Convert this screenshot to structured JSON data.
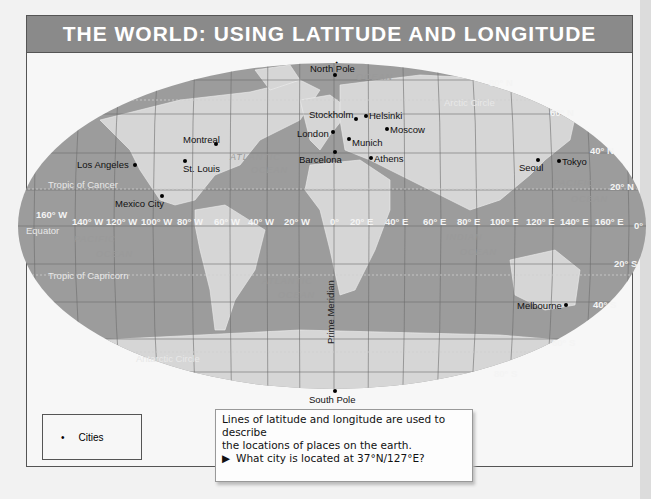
{
  "title": "THE WORLD: USING LATITUDE AND LONGITUDE",
  "poles": {
    "north": "North Pole",
    "south": "South Pole"
  },
  "cities": [
    {
      "name": "Los Angeles",
      "x": 135,
      "y": 165,
      "lx": 77,
      "ly": 159
    },
    {
      "name": "St. Louis",
      "x": 185,
      "y": 161,
      "lx": 183,
      "ly": 163
    },
    {
      "name": "Montreal",
      "x": 216,
      "y": 144,
      "lx": 183,
      "ly": 134
    },
    {
      "name": "Mexico City",
      "x": 162,
      "y": 196,
      "lx": 115,
      "ly": 198
    },
    {
      "name": "Stockholm",
      "x": 356,
      "y": 119,
      "lx": 309,
      "ly": 109
    },
    {
      "name": "Helsinki",
      "x": 366,
      "y": 116,
      "lx": 369,
      "ly": 110
    },
    {
      "name": "London",
      "x": 333,
      "y": 132,
      "lx": 297,
      "ly": 128
    },
    {
      "name": "Moscow",
      "x": 387,
      "y": 129,
      "lx": 390,
      "ly": 124
    },
    {
      "name": "Munich",
      "x": 349,
      "y": 139,
      "lx": 352,
      "ly": 137
    },
    {
      "name": "Barcelona",
      "x": 335,
      "y": 152,
      "lx": 299,
      "ly": 154
    },
    {
      "name": "Athens",
      "x": 371,
      "y": 158,
      "lx": 374,
      "ly": 153
    },
    {
      "name": "Seoul",
      "x": 538,
      "y": 160,
      "lx": 519,
      "ly": 162
    },
    {
      "name": "Tokyo",
      "x": 559,
      "y": 161,
      "lx": 562,
      "ly": 156
    },
    {
      "name": "Melbourne",
      "x": 566,
      "y": 305,
      "lx": 517,
      "ly": 300
    }
  ],
  "latitude_labels": [
    {
      "text": "80° N",
      "x": 489,
      "y": 83
    },
    {
      "text": "60° N",
      "x": 550,
      "y": 113
    },
    {
      "text": "40° N",
      "x": 590,
      "y": 151
    },
    {
      "text": "20° N",
      "x": 610,
      "y": 187
    },
    {
      "text": "0°",
      "x": 634,
      "y": 226
    },
    {
      "text": "20° S",
      "x": 614,
      "y": 264
    },
    {
      "text": "40° S",
      "x": 593,
      "y": 305
    },
    {
      "text": "60° S",
      "x": 552,
      "y": 343
    },
    {
      "text": "80° S",
      "x": 494,
      "y": 374
    }
  ],
  "longitude_labels": [
    {
      "text": "160° W",
      "x": 36,
      "y": 215
    },
    {
      "text": "140° W",
      "x": 72,
      "y": 222
    },
    {
      "text": "120° W",
      "x": 106,
      "y": 222
    },
    {
      "text": "100° W",
      "x": 141,
      "y": 222
    },
    {
      "text": "80° W",
      "x": 177,
      "y": 222
    },
    {
      "text": "60° W",
      "x": 214,
      "y": 222
    },
    {
      "text": "40° W",
      "x": 248,
      "y": 222
    },
    {
      "text": "20° W",
      "x": 284,
      "y": 222
    },
    {
      "text": "0°",
      "x": 330,
      "y": 222
    },
    {
      "text": "20° E",
      "x": 350,
      "y": 222
    },
    {
      "text": "40° E",
      "x": 385,
      "y": 222
    },
    {
      "text": "60° E",
      "x": 423,
      "y": 222
    },
    {
      "text": "80° E",
      "x": 457,
      "y": 222
    },
    {
      "text": "100° E",
      "x": 490,
      "y": 222
    },
    {
      "text": "120° E",
      "x": 526,
      "y": 222
    },
    {
      "text": "140° E",
      "x": 560,
      "y": 222
    },
    {
      "text": "160° E",
      "x": 595,
      "y": 222
    }
  ],
  "line_labels": [
    {
      "text": "Equator",
      "x": 26,
      "y": 231
    },
    {
      "text": "Tropic of Cancer",
      "x": 48,
      "y": 185
    },
    {
      "text": "Tropic of Capricorn",
      "x": 48,
      "y": 276
    },
    {
      "text": "Arctic Circle",
      "x": 444,
      "y": 103
    },
    {
      "text": "Antarctic Circle",
      "x": 136,
      "y": 359
    }
  ],
  "ocean_labels": [
    {
      "text": "ATLANTIC",
      "x": 230,
      "y": 158
    },
    {
      "text": "OCEAN",
      "x": 251,
      "y": 171
    },
    {
      "text": "PACIFIC",
      "x": 74,
      "y": 240
    },
    {
      "text": "OCEAN",
      "x": 96,
      "y": 255
    },
    {
      "text": "ATLANTIC",
      "x": 262,
      "y": 282
    },
    {
      "text": "OCEAN",
      "x": 278,
      "y": 296
    },
    {
      "text": "INDIAN",
      "x": 446,
      "y": 238
    },
    {
      "text": "OCEAN",
      "x": 460,
      "y": 253
    },
    {
      "text": "PACIFIC",
      "x": 553,
      "y": 184
    },
    {
      "text": "OCEAN",
      "x": 571,
      "y": 200
    },
    {
      "text": "OCEAN",
      "x": 356,
      "y": 78
    }
  ],
  "prime_meridian_label": "Prime Meridian",
  "legend": {
    "symbol": "•",
    "label": "Cities"
  },
  "note": {
    "line1": "Lines of latitude and longitude are used to describe",
    "line2": "the locations of places on the earth.",
    "question_marker": "▶",
    "question": "What city is located at 37°N/127°E?"
  }
}
